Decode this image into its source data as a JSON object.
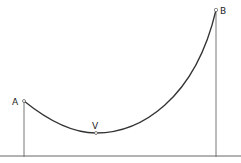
{
  "diagram": {
    "type": "catenary-cable-between-posts",
    "points": {
      "A": {
        "label": "A"
      },
      "V": {
        "label": "V"
      },
      "B": {
        "label": "B"
      }
    }
  }
}
